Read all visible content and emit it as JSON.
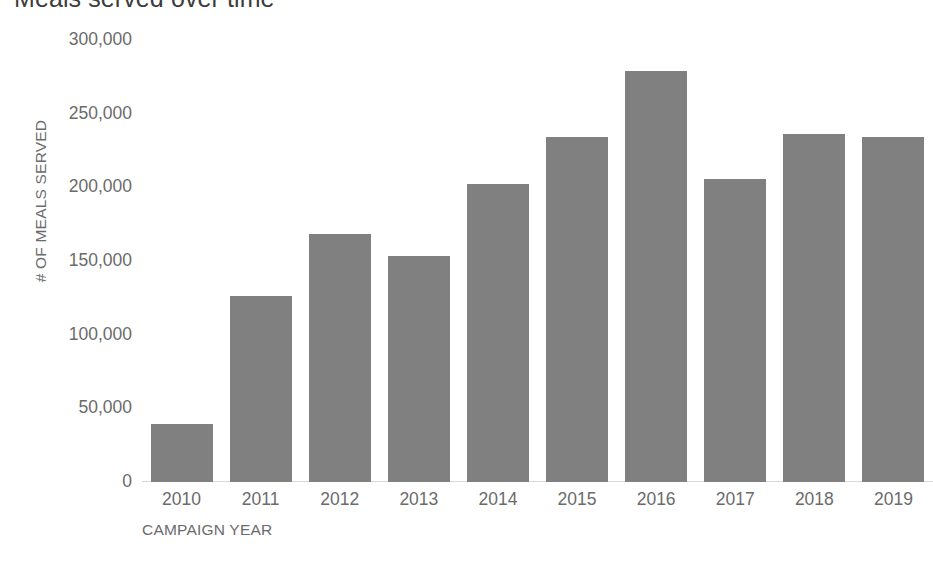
{
  "chart_data": {
    "type": "bar",
    "title": "Meals served over time",
    "xlabel": "CAMPAIGN YEAR",
    "ylabel": "# OF MEALS SERVED",
    "categories": [
      "2010",
      "2011",
      "2012",
      "2013",
      "2014",
      "2015",
      "2016",
      "2017",
      "2018",
      "2019"
    ],
    "values": [
      39500,
      126500,
      168000,
      153500,
      202500,
      234500,
      279000,
      206000,
      236000,
      234500
    ],
    "ylim": [
      0,
      300000
    ],
    "yticks": [
      0,
      50000,
      100000,
      150000,
      200000,
      250000,
      300000
    ],
    "ytick_labels": [
      "0",
      "50,000",
      "100,000",
      "150,000",
      "200,000",
      "250,000",
      "300,000"
    ],
    "grid": false,
    "legend": "none",
    "bar_color": "#808080",
    "axis_color": "#d9d9d9",
    "text_color": "#6b6b6b"
  }
}
